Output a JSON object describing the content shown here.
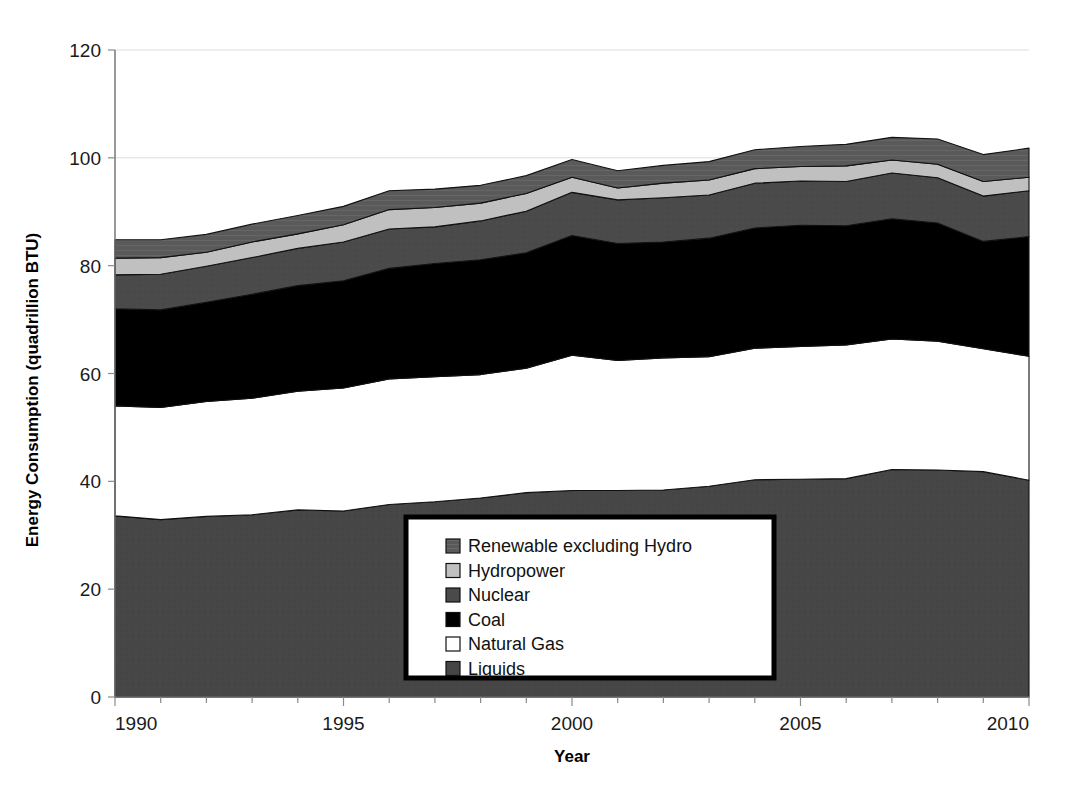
{
  "chart_data": {
    "type": "area",
    "stacked": true,
    "title": "",
    "xlabel": "Year",
    "ylabel": "Energy Consumption (quadrillion BTU)",
    "xlim": [
      1990,
      2010
    ],
    "ylim": [
      0,
      120
    ],
    "ytick_values": [
      0,
      20,
      40,
      60,
      80,
      100,
      120
    ],
    "ytick_labels": [
      "0",
      "20",
      "40",
      "60",
      "80",
      "100",
      "120"
    ],
    "xtick_values": [
      1990,
      1995,
      2000,
      2005,
      2010
    ],
    "xtick_labels": [
      "1990",
      "1995",
      "2000",
      "2005",
      "2010"
    ],
    "x_minor_tick_step": 1,
    "grid": "horizontal-light",
    "legend_position": "inside-bottom-center",
    "x": [
      1990,
      1991,
      1992,
      1993,
      1994,
      1995,
      1996,
      1997,
      1998,
      1999,
      2000,
      2001,
      2002,
      2003,
      2004,
      2005,
      2006,
      2007,
      2008,
      2009,
      2010
    ],
    "series": [
      {
        "name": "Liquids",
        "color": "#464646",
        "values": [
          33.6,
          32.9,
          33.5,
          33.8,
          34.7,
          34.5,
          35.7,
          36.2,
          36.9,
          37.9,
          38.3,
          38.3,
          38.4,
          39.1,
          40.3,
          40.4,
          40.5,
          42.2,
          42.1,
          41.8,
          40.2
        ]
      },
      {
        "name": "Natural Gas",
        "color": "#ffffff",
        "values": [
          20.4,
          20.8,
          21.3,
          21.6,
          22.0,
          22.8,
          23.3,
          23.2,
          22.9,
          23.1,
          25.1,
          24.1,
          24.5,
          24.0,
          24.4,
          24.6,
          24.8,
          24.2,
          23.9,
          22.8,
          23.0
        ]
      },
      {
        "name": "Coal",
        "color": "#000000",
        "values": [
          18.0,
          18.1,
          18.4,
          19.3,
          19.6,
          19.9,
          20.5,
          21.0,
          21.3,
          21.4,
          22.2,
          21.7,
          21.5,
          22.0,
          22.3,
          22.5,
          22.1,
          22.3,
          21.9,
          19.9,
          22.2
        ]
      },
      {
        "name": "Nuclear",
        "color": "#4a4a4a",
        "values": [
          6.3,
          6.6,
          6.7,
          6.8,
          6.9,
          7.2,
          7.3,
          6.8,
          7.2,
          7.7,
          8.0,
          8.1,
          8.2,
          8.0,
          8.3,
          8.2,
          8.2,
          8.5,
          8.4,
          8.4,
          8.5
        ]
      },
      {
        "name": "Hydropower",
        "color": "#c0c0c0",
        "values": [
          3.1,
          3.1,
          2.6,
          2.9,
          2.7,
          3.2,
          3.6,
          3.6,
          3.3,
          3.3,
          2.8,
          2.2,
          2.7,
          2.8,
          2.7,
          2.7,
          2.9,
          2.4,
          2.5,
          2.7,
          2.5
        ]
      },
      {
        "name": "Renewable excluding Hydro",
        "color": "#5a5a5a",
        "values": [
          3.4,
          3.3,
          3.3,
          3.3,
          3.4,
          3.4,
          3.5,
          3.4,
          3.3,
          3.3,
          3.3,
          3.2,
          3.3,
          3.4,
          3.5,
          3.7,
          4.0,
          4.2,
          4.7,
          5.0,
          5.4
        ]
      }
    ],
    "annotations": []
  },
  "legend": {
    "items": [
      {
        "label": "Renewable excluding Hydro",
        "swatch": "#5a5a5a",
        "pattern": "hatch"
      },
      {
        "label": "Hydropower",
        "swatch": "#c0c0c0",
        "pattern": "solid"
      },
      {
        "label": "Nuclear",
        "swatch": "#4a4a4a",
        "pattern": "solid"
      },
      {
        "label": "Coal",
        "swatch": "#000000",
        "pattern": "solid"
      },
      {
        "label": "Natural Gas",
        "swatch": "#ffffff",
        "pattern": "solid"
      },
      {
        "label": "Liquids",
        "swatch": "#464646",
        "pattern": "solid"
      }
    ]
  },
  "colors": {
    "background": "#ffffff",
    "axis": "#6e6e6e",
    "text": "#111111",
    "grid": "#dcdcdc"
  }
}
